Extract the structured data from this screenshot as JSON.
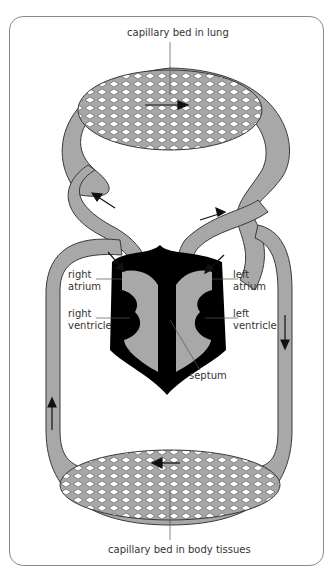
{
  "diagram": {
    "title_labels": {
      "top": "capillary bed in lung",
      "bottom": "capillary bed in body tissues"
    },
    "heart_labels": {
      "right_atrium": [
        "right",
        "atrium"
      ],
      "right_ventricle": [
        "right",
        "ventricle"
      ],
      "left_atrium": [
        "left",
        "atrium"
      ],
      "left_ventricle": [
        "left",
        "ventricle"
      ],
      "septum": "septum"
    },
    "colors": {
      "vessel": "#a8a8a8",
      "outline": "#3a3a3a",
      "heart_wall": "#000000",
      "frame": "#8a8a8a"
    }
  }
}
